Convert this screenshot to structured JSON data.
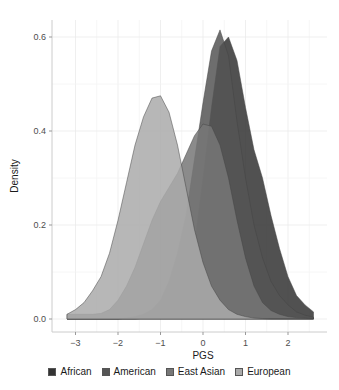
{
  "chart_data": {
    "type": "area",
    "title": "",
    "xlabel": "PGS",
    "ylabel": "Density",
    "xlim": [
      -3.3,
      2.7
    ],
    "ylim": [
      -0.01,
      0.64
    ],
    "x_ticks": [
      -3,
      -2,
      -1,
      0,
      1,
      2
    ],
    "x_tick_labels": [
      "−3",
      "−2",
      "−1",
      "0",
      "1",
      "2"
    ],
    "y_ticks": [
      0.0,
      0.2,
      0.4,
      0.6
    ],
    "y_tick_labels": [
      "0.0",
      "0.2",
      "0.4",
      "0.6"
    ],
    "grid": true,
    "legend_position": "bottom",
    "x": [
      -3.2,
      -3.0,
      -2.8,
      -2.6,
      -2.4,
      -2.2,
      -2.0,
      -1.8,
      -1.6,
      -1.4,
      -1.2,
      -1.0,
      -0.8,
      -0.6,
      -0.4,
      -0.2,
      0.0,
      0.2,
      0.4,
      0.6,
      0.8,
      1.0,
      1.2,
      1.4,
      1.6,
      1.8,
      2.0,
      2.2,
      2.4,
      2.6
    ],
    "series": [
      {
        "name": "African",
        "color": "#333333",
        "values": [
          0.0,
          0.0,
          0.0,
          0.0,
          0.0,
          0.0,
          0.0,
          0.0,
          0.0,
          0.002,
          0.005,
          0.01,
          0.02,
          0.04,
          0.08,
          0.16,
          0.3,
          0.45,
          0.58,
          0.6,
          0.55,
          0.45,
          0.36,
          0.3,
          0.22,
          0.15,
          0.09,
          0.05,
          0.03,
          0.015
        ]
      },
      {
        "name": "American",
        "color": "#555555",
        "values": [
          0.0,
          0.0,
          0.0,
          0.0,
          0.0,
          0.0,
          0.0,
          0.002,
          0.005,
          0.01,
          0.02,
          0.04,
          0.08,
          0.14,
          0.22,
          0.34,
          0.46,
          0.57,
          0.615,
          0.56,
          0.42,
          0.3,
          0.2,
          0.13,
          0.08,
          0.05,
          0.03,
          0.015,
          0.008,
          0.004
        ]
      },
      {
        "name": "East Asian",
        "color": "#777777",
        "values": [
          0.01,
          0.01,
          0.01,
          0.01,
          0.012,
          0.02,
          0.04,
          0.07,
          0.11,
          0.16,
          0.21,
          0.25,
          0.28,
          0.31,
          0.35,
          0.39,
          0.415,
          0.41,
          0.37,
          0.3,
          0.21,
          0.13,
          0.07,
          0.035,
          0.018,
          0.01,
          0.005,
          0.003,
          0.002,
          0.001
        ]
      },
      {
        "name": "European",
        "color": "#aaaaaa",
        "values": [
          0.01,
          0.02,
          0.035,
          0.06,
          0.09,
          0.14,
          0.21,
          0.29,
          0.37,
          0.43,
          0.47,
          0.475,
          0.44,
          0.37,
          0.28,
          0.19,
          0.12,
          0.07,
          0.04,
          0.02,
          0.01,
          0.005,
          0.002,
          0.001,
          0.0,
          0.0,
          0.0,
          0.0,
          0.0,
          0.0
        ]
      }
    ]
  },
  "legend": {
    "items": [
      {
        "label": "African",
        "color": "#333333"
      },
      {
        "label": "American",
        "color": "#555555"
      },
      {
        "label": "East Asian",
        "color": "#777777"
      },
      {
        "label": "European",
        "color": "#aaaaaa"
      }
    ]
  }
}
